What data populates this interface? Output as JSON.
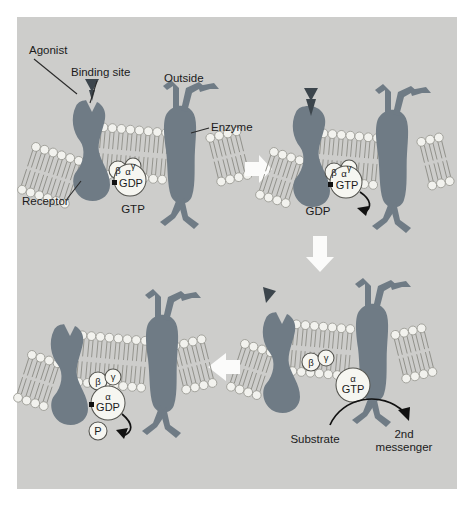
{
  "figure": {
    "background_color": "#cdcdcb",
    "protein_color": "#6f7b85",
    "lipid_head_color": "#f2f2ee",
    "bubble_color": "#f6f6f1",
    "arrow_color": "#fbfbfa",
    "ink_color": "#1b1b1b"
  },
  "labels": {
    "agonist": "Agonist",
    "binding_site": "Binding site",
    "outside": "Outside",
    "enzyme": "Enzyme",
    "receptor": "Receptor",
    "substrate": "Substrate",
    "second_messenger_line1": "2nd",
    "second_messenger_line2": "messenger"
  },
  "subunits": {
    "alpha": "α",
    "beta": "β",
    "gamma": "γ"
  },
  "nucleotides": {
    "gdp": "GDP",
    "gtp": "GTP",
    "phosphate": "P"
  },
  "panels": [
    {
      "id": "panel-1",
      "position": "top-left",
      "state": "resting",
      "description": "Agonist approaches receptor binding site; heterotrimeric G-protein with alpha-GDP, beta and gamma subunits docked at inner membrane leaflet; free GTP in cytosol; effector enzyme separate in membrane",
      "bubble_labels": [
        "β",
        "γ",
        "α",
        "GDP"
      ],
      "free_labels": [
        "GTP"
      ],
      "callouts": [
        "Agonist",
        "Binding site",
        "Outside",
        "Enzyme",
        "Receptor"
      ]
    },
    {
      "id": "panel-2",
      "position": "top-right",
      "state": "agonist-bound, GDP/GTP exchange",
      "description": "Agonist occupies binding site, receptor changes conformation, GDP is released from the alpha subunit and replaced by GTP",
      "bubble_labels": [
        "β",
        "γ",
        "α",
        "GTP"
      ],
      "free_labels": [
        "GDP"
      ],
      "curved_arrow": "GTP replaces GDP which leaves the alpha subunit"
    },
    {
      "id": "panel-3",
      "position": "bottom-right",
      "state": "dissociation and effector activation",
      "description": "Agonist dissociates; alpha-GTP separates from the beta-gamma dimer, migrates to and activates the enzyme which converts substrate into second messenger",
      "bubble_labels": [
        "β",
        "γ",
        "α",
        "GTP"
      ],
      "free_labels": [
        "Substrate",
        "2nd",
        "messenger"
      ],
      "curved_arrow": "Substrate converted to 2nd messenger by activated enzyme"
    },
    {
      "id": "panel-4",
      "position": "bottom-left",
      "state": "GTP hydrolysis and reassociation",
      "description": "Alpha subunit hydrolyses GTP to GDP releasing inorganic phosphate, then reassociates with beta-gamma to reform the resting heterotrimer",
      "bubble_labels": [
        "β",
        "γ",
        "α",
        "GDP"
      ],
      "free_labels": [
        "P"
      ],
      "curved_arrow": "Inorganic phosphate released on GTP hydrolysis"
    }
  ],
  "flow_arrows": [
    {
      "name": "arrow-panel1-to-panel2",
      "direction": "right"
    },
    {
      "name": "arrow-panel2-to-panel3",
      "direction": "down"
    },
    {
      "name": "arrow-panel3-to-panel4",
      "direction": "left"
    }
  ]
}
